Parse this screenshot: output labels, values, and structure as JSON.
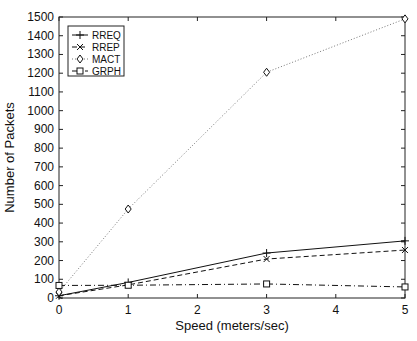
{
  "chart_data": {
    "type": "line",
    "title": "",
    "xlabel": "Speed (meters/sec)",
    "ylabel": "Number of Packets",
    "x": [
      0,
      1,
      3,
      5
    ],
    "xlim": [
      0,
      5
    ],
    "ylim": [
      0,
      1500
    ],
    "xticks": [
      0,
      1,
      2,
      3,
      4,
      5
    ],
    "yticks": [
      0,
      100,
      200,
      300,
      400,
      500,
      600,
      700,
      800,
      900,
      1000,
      1100,
      1200,
      1300,
      1400,
      1500
    ],
    "grid": false,
    "legend_position": "upper left",
    "series": [
      {
        "name": "RREQ",
        "values": [
          12,
          83,
          240,
          305
        ],
        "style": "solid",
        "marker": "plus"
      },
      {
        "name": "RREP",
        "values": [
          12,
          70,
          208,
          256
        ],
        "style": "dashed",
        "marker": "x"
      },
      {
        "name": "MACT",
        "values": [
          32,
          475,
          1205,
          1490
        ],
        "style": "dotted",
        "marker": "diamond"
      },
      {
        "name": "GRPH",
        "values": [
          67,
          68,
          75,
          59
        ],
        "style": "dashdot",
        "marker": "square"
      }
    ]
  }
}
